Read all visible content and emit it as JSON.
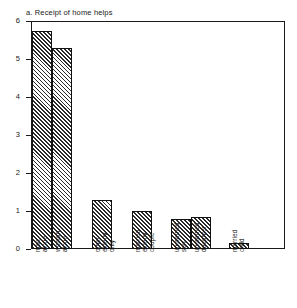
{
  "chart_data": {
    "type": "bar",
    "title": "a.  Receipt of home helps",
    "xlabel": "",
    "ylabel": "",
    "ylim": [
      0,
      6
    ],
    "yticks": [
      "0",
      "1",
      "2",
      "3",
      "4",
      "5",
      "6"
    ],
    "grid": false,
    "legend": null,
    "categories": [
      "man alone",
      "woman alone",
      "other elderly only",
      "married elderly couple",
      "unmarried son",
      "unmarried daughter",
      "married child"
    ],
    "values": [
      5.75,
      5.3,
      1.3,
      1.0,
      0.78,
      0.85,
      0.15
    ]
  },
  "labels": {
    "cat0": [
      "man",
      "alone"
    ],
    "cat1": [
      "woman",
      "alone"
    ],
    "cat2": [
      "other",
      "elderly",
      "only"
    ],
    "cat3": [
      "married",
      "elderly",
      "couple"
    ],
    "cat4": [
      "unmarried",
      "son"
    ],
    "cat5": [
      "unmarried",
      "daughter"
    ],
    "cat6": [
      "married",
      "child"
    ]
  },
  "style": {
    "bar_hatch_color": "#2b2b2b",
    "axis_color": "#1a1a1a",
    "background": "#ffffff"
  }
}
